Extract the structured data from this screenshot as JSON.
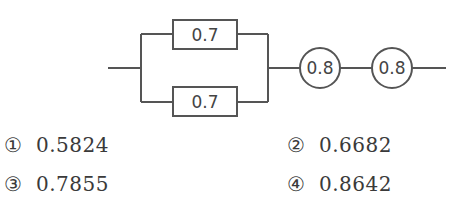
{
  "diagram": {
    "parallel_block": {
      "top_component": {
        "label": "0.7",
        "shape": "rectangle"
      },
      "bottom_component": {
        "label": "0.7",
        "shape": "rectangle"
      }
    },
    "series_components": [
      {
        "label": "0.8",
        "shape": "circle"
      },
      {
        "label": "0.8",
        "shape": "circle"
      }
    ],
    "line_color": "#555555"
  },
  "options": [
    {
      "marker": "①",
      "value": "0.5824"
    },
    {
      "marker": "②",
      "value": "0.6682"
    },
    {
      "marker": "③",
      "value": "0.7855"
    },
    {
      "marker": "④",
      "value": "0.8642"
    }
  ]
}
